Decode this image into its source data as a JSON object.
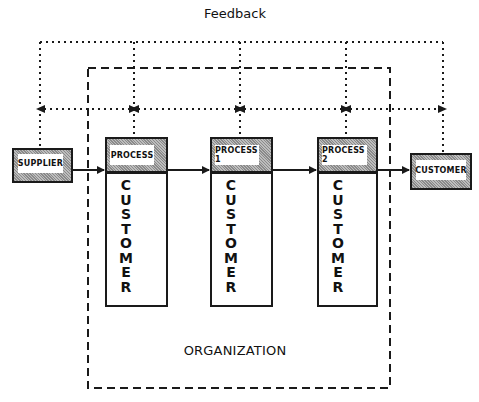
{
  "diagram": {
    "title": "Feedback",
    "organization_label": "ORGANIZATION",
    "supplier": {
      "label": "SUPPLIER"
    },
    "processes": [
      {
        "label": "PROCESS",
        "customer_label": "CUSTOMER"
      },
      {
        "label": "PROCESS 1",
        "customer_label": "CUSTOMER"
      },
      {
        "label": "PROCESS 2",
        "customer_label": "CUSTOMER"
      }
    ],
    "customer": {
      "label": "CUSTOMER"
    },
    "colors": {
      "line": "#1a1a1a",
      "shade": "#9e9e9e",
      "background": "#ffffff"
    }
  }
}
